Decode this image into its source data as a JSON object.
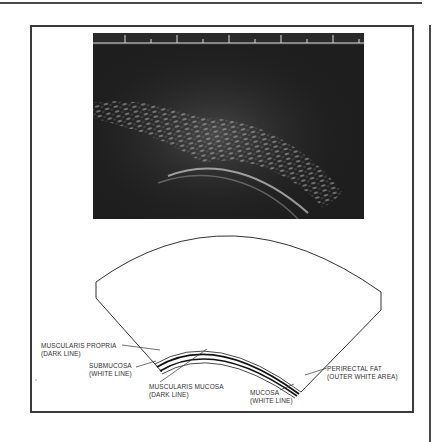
{
  "figure": {
    "ultrasound_image": {
      "description": "Endorectal ultrasound image showing layered rectal wall",
      "scale_ticks": 11
    },
    "diagram": {
      "labels": {
        "muscularis_propria": {
          "line1": "MUSCULARIS PROPRIA",
          "line2": "(DARK LINE)"
        },
        "submucosa": {
          "line1": "SUBMUCOSA",
          "line2": "(WHITE LINE)"
        },
        "muscularis_mucosa": {
          "line1": "MUSCULARIS MUCOSA",
          "line2": "(DARK LINE)"
        },
        "mucosa": {
          "line1": "MUCOSA",
          "line2": "(WHITE LINE)"
        },
        "perirectal_fat": {
          "line1": "PERIRECTAL FAT",
          "line2": "(OUTER WHITE AREA)"
        }
      }
    }
  },
  "colors": {
    "border": "#3a3a3a",
    "ultrasound_bg": "#1e1e1e",
    "text": "#333333"
  }
}
